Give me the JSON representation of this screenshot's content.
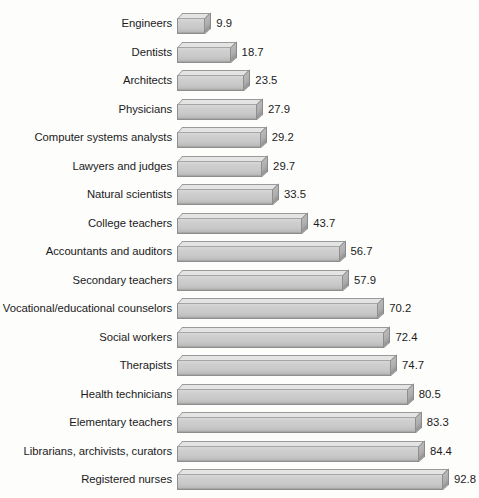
{
  "chart_data": {
    "type": "bar",
    "orientation": "horizontal",
    "title": "",
    "subtitle": "",
    "xlabel": "",
    "ylabel": "",
    "grid": false,
    "legend": null,
    "axis_visible": false,
    "tick_labels": [],
    "xlim": [
      0,
      100
    ],
    "value_label_format": "one-decimal",
    "categories": [
      "Engineers",
      "Dentists",
      "Architects",
      "Physicians",
      "Computer systems analysts",
      "Lawyers and judges",
      "Natural scientists",
      "College teachers",
      "Accountants and auditors",
      "Secondary teachers",
      "Vocational/educational counselors",
      "Social workers",
      "Therapists",
      "Health technicians",
      "Elementary teachers",
      "Librarians, archivists, curators",
      "Registered nurses"
    ],
    "values": [
      9.9,
      18.7,
      23.5,
      27.9,
      29.2,
      29.7,
      33.5,
      43.7,
      56.7,
      57.9,
      70.2,
      72.4,
      74.7,
      80.5,
      83.3,
      84.4,
      92.8
    ],
    "value_labels": [
      "9.9",
      "18.7",
      "23.5",
      "27.9",
      "29.2",
      "29.7",
      "33.5",
      "43.7",
      "56.7",
      "57.9",
      "70.2",
      "72.4",
      "74.7",
      "80.5",
      "83.3",
      "84.4",
      "92.8"
    ],
    "colors": {
      "background": "#fdfdfc",
      "bar_front": "#c9c9c9",
      "bar_top": "#e4e4e4",
      "bar_side": "#adadad",
      "bar_outline": "#8e8e8e",
      "text": "#1b1b1b"
    }
  }
}
